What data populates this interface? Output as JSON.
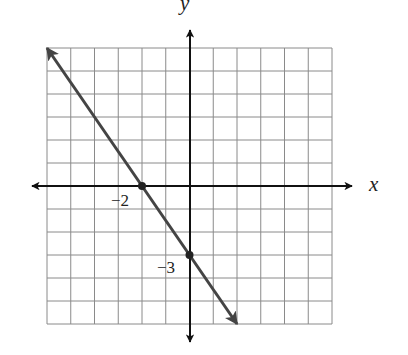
{
  "chart_data": {
    "type": "line",
    "title": "",
    "xlabel": "x",
    "ylabel": "y",
    "xlim": [
      -6,
      6
    ],
    "ylim": [
      -6,
      6
    ],
    "grid": true,
    "grid_step": 1,
    "series": [
      {
        "name": "line",
        "equation": "y = -1.5x - 3",
        "x": [
          -6,
          -2,
          0,
          2
        ],
        "y": [
          6,
          0,
          -3,
          -6
        ],
        "arrows_both_ends": true
      }
    ],
    "points": [
      {
        "x": -2,
        "y": 0,
        "label": "−2"
      },
      {
        "x": 0,
        "y": -3,
        "label": "−3"
      }
    ],
    "annotations": [
      "−2",
      "−3"
    ]
  },
  "labels": {
    "x_axis": "x",
    "y_axis": "y",
    "x_intercept": "−2",
    "y_intercept": "−3"
  },
  "colors": {
    "grid": "#8a8a8a",
    "axes": "#111111",
    "line": "#444444",
    "point": "#222222"
  }
}
